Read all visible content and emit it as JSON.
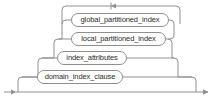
{
  "diagram": {
    "kind": "railroad-syntax-diagram",
    "width": 220,
    "height": 102,
    "background_color": "#ffffff",
    "line_color": "#8f8f8f",
    "text_color": "#2b2b2b",
    "nodes": [
      {
        "id": "global_partitioned_index",
        "label": "global_partitioned_index",
        "type": "nonterminal",
        "x": 71,
        "y": 13,
        "width": 98,
        "height": 14
      },
      {
        "id": "local_partitioned_index",
        "label": "local_partitioned_index",
        "type": "nonterminal",
        "x": 71,
        "y": 32,
        "width": 95,
        "height": 14
      },
      {
        "id": "index_attributes",
        "label": "index_attributes",
        "type": "nonterminal",
        "x": 57,
        "y": 51,
        "width": 70,
        "height": 14
      },
      {
        "id": "domain_index_clause",
        "label": "domain_index_clause",
        "type": "nonterminal",
        "x": 37,
        "y": 70,
        "width": 86,
        "height": 14
      }
    ],
    "markers": {
      "entry_arrow": "arrow-right",
      "exit_arrow": "arrow-right",
      "loopback_arrow": "arrow-left"
    }
  }
}
